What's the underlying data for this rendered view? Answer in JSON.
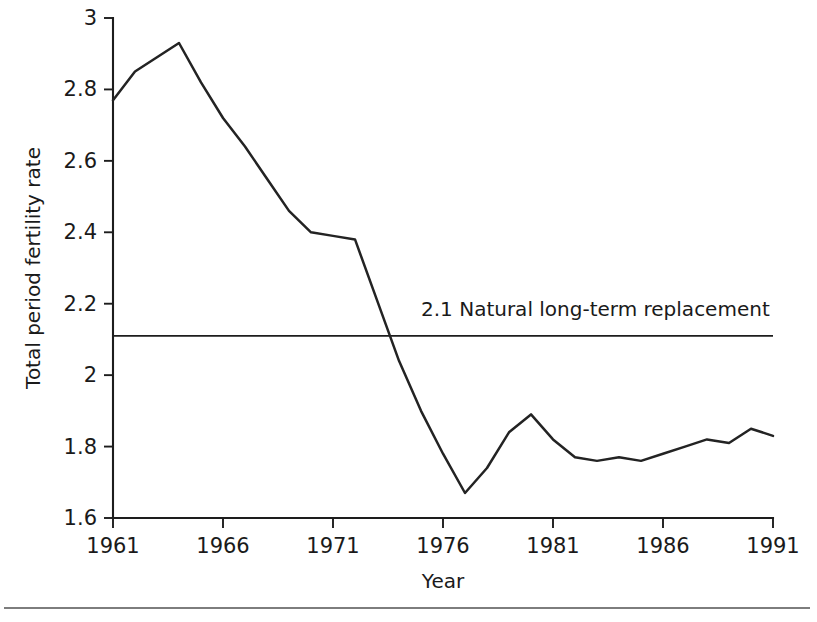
{
  "chart_data": {
    "type": "line",
    "title": "",
    "subtitle": "",
    "xlabel": "Year",
    "ylabel": "Total period fertility rate",
    "xlim": [
      1961,
      1991
    ],
    "ylim": [
      1.6,
      3.0
    ],
    "grid": false,
    "legend": "none",
    "x_ticks": [
      "1961",
      "1966",
      "1971",
      "1976",
      "1981",
      "1986",
      "1991"
    ],
    "x_tick_values": [
      1961,
      1966,
      1971,
      1976,
      1981,
      1986,
      1991
    ],
    "y_ticks": [
      "1.6",
      "1.8",
      "2",
      "2.2",
      "2.4",
      "2.6",
      "2.8",
      "3"
    ],
    "y_tick_values": [
      1.6,
      1.8,
      2.0,
      2.2,
      2.4,
      2.6,
      2.8,
      3.0
    ],
    "x": [
      1961,
      1962,
      1963,
      1964,
      1965,
      1966,
      1967,
      1968,
      1969,
      1970,
      1971,
      1972,
      1973,
      1974,
      1975,
      1976,
      1977,
      1978,
      1979,
      1980,
      1981,
      1982,
      1983,
      1984,
      1985,
      1986,
      1987,
      1988,
      1989,
      1990,
      1991
    ],
    "series": [
      {
        "name": "Total period fertility rate",
        "color": "#232323",
        "values": [
          2.77,
          2.85,
          2.89,
          2.93,
          2.82,
          2.72,
          2.64,
          2.55,
          2.46,
          2.4,
          2.39,
          2.38,
          2.21,
          2.04,
          1.9,
          1.78,
          1.67,
          1.74,
          1.84,
          1.89,
          1.82,
          1.77,
          1.76,
          1.77,
          1.76,
          1.78,
          1.8,
          1.82,
          1.81,
          1.85,
          1.83
        ]
      }
    ],
    "reference_lines": [
      {
        "name": "natural-replacement-line",
        "value": 2.11,
        "orientation": "horizontal",
        "label": "2.1 Natural long-term replacement",
        "label_x": 1975.0,
        "color": "#1d1d1d"
      }
    ]
  }
}
